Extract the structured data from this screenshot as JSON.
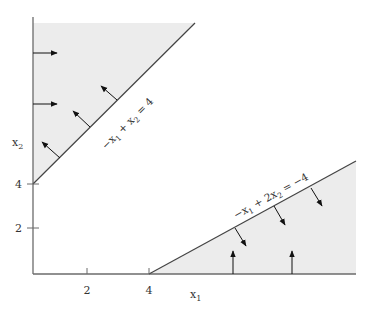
{
  "diagram": {
    "type": "linear-inequality-feasible-regions",
    "colors": {
      "shade": "#ececec",
      "axis": "#6b6b6b",
      "line": "#444444",
      "arrow": "#111111",
      "text": "#333333"
    },
    "axes": {
      "x_label": "x",
      "x_label_sub": "1",
      "y_label": "x",
      "y_label_sub": "2",
      "x_ticks": [
        {
          "value": 2,
          "label": "2"
        },
        {
          "value": 4,
          "label": "4"
        }
      ],
      "y_ticks": [
        {
          "value": 2,
          "label": "2"
        },
        {
          "value": 4,
          "label": "4"
        }
      ]
    },
    "constraints": [
      {
        "id": "upper",
        "equation": "−x₁ + x₂ = 4",
        "label_parts": [
          "−x",
          "1",
          " + x",
          "2",
          " = 4"
        ],
        "region": "above-left (−x₁ + x₂ ≥ 4)"
      },
      {
        "id": "lower",
        "equation": "−x₁ + 2x₂ = −4",
        "label_parts": [
          "−x",
          "1",
          " + 2x",
          "2",
          " = −4"
        ],
        "region": "below-right (−x₁ + 2x₂ ≤ −4, x₂ ≥ 0)"
      }
    ]
  }
}
